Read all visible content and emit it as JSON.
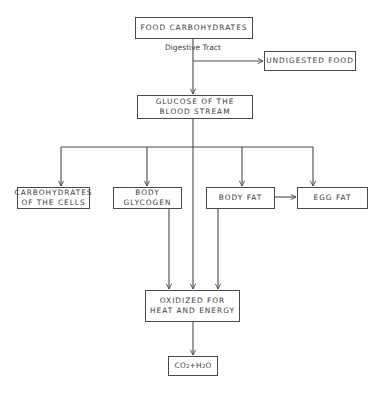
{
  "diagram": {
    "type": "flowchart",
    "nodes": {
      "food_carbohydrates": "FOOD CARBOHYDRATES",
      "undigested_food": "UNDIGESTED FOOD",
      "glucose": "GLUCOSE OF THE\nBLOOD STREAM",
      "carbohydrates_cells": "CARBOHYDRATES\nOF THE CELLS",
      "body_glycogen": "BODY\nGLYCOGEN",
      "body_fat": "BODY FAT",
      "egg_fat": "EGG FAT",
      "oxidized": "OXIDIZED FOR\nHEAT AND ENERGY",
      "co2_h2o": {
        "co": "CO",
        "sub1": "2",
        "plus": " +H",
        "sub2": "2",
        "o": "O"
      }
    },
    "edge_labels": {
      "digestive_tract": "Digestive Tract"
    },
    "edges": [
      [
        "FOOD CARBOHYDRATES",
        "GLUCOSE OF THE BLOOD STREAM"
      ],
      [
        "FOOD CARBOHYDRATES",
        "UNDIGESTED FOOD"
      ],
      [
        "GLUCOSE OF THE BLOOD STREAM",
        "CARBOHYDRATES OF THE CELLS"
      ],
      [
        "GLUCOSE OF THE BLOOD STREAM",
        "BODY GLYCOGEN"
      ],
      [
        "GLUCOSE OF THE BLOOD STREAM",
        "BODY FAT"
      ],
      [
        "GLUCOSE OF THE BLOOD STREAM",
        "EGG FAT"
      ],
      [
        "GLUCOSE OF THE BLOOD STREAM",
        "OXIDIZED FOR HEAT AND ENERGY"
      ],
      [
        "BODY FAT",
        "EGG FAT"
      ],
      [
        "BODY GLYCOGEN",
        "OXIDIZED FOR HEAT AND ENERGY"
      ],
      [
        "BODY FAT",
        "OXIDIZED FOR HEAT AND ENERGY"
      ],
      [
        "OXIDIZED FOR HEAT AND ENERGY",
        "CO2 + H2O"
      ]
    ],
    "colors": {
      "line": "#4a4a4a",
      "text": "#3e3e3e",
      "background": "#ffffff"
    }
  }
}
